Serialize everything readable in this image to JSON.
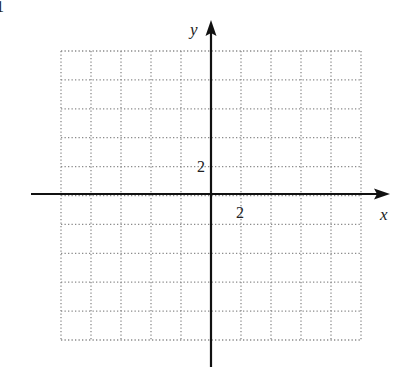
{
  "chart_data": {
    "type": "scatter",
    "title": "",
    "figure_number": "1",
    "xlabel": "x",
    "ylabel": "y",
    "xlim": [
      -10,
      10
    ],
    "ylim": [
      -10,
      10
    ],
    "grid": true,
    "grid_style": "dotted",
    "grid_step": 2,
    "tick_labels": {
      "x": [
        "2"
      ],
      "y": [
        "2"
      ]
    },
    "series": [],
    "legend": null
  },
  "colors": {
    "axis": "#111111",
    "grid": "#8a8a8a",
    "background": "#ffffff"
  }
}
